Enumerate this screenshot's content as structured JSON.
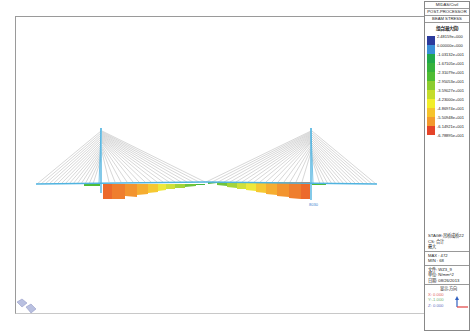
{
  "panel": {
    "header_line1": "MIDAS/Civil",
    "header_line2": "POST-PROCESSOR",
    "result_type": "BEAM STRESS",
    "legend_title": "组合(最大值)",
    "legend": [
      {
        "value": "2.48159e+000",
        "color": "#2b3a9c"
      },
      {
        "value": "0.00000e+000",
        "color": "#3a8fd6"
      },
      {
        "value": "-1.03132e+001",
        "color": "#21a84b"
      },
      {
        "value": "-1.67105e+001",
        "color": "#36b23c"
      },
      {
        "value": "-2.31079e+001",
        "color": "#4fbd33"
      },
      {
        "value": "-2.95053e+001",
        "color": "#8ccd2e"
      },
      {
        "value": "-3.59027e+001",
        "color": "#c5dc2a"
      },
      {
        "value": "-4.23000e+001",
        "color": "#f2ee2a"
      },
      {
        "value": "-4.86974e+001",
        "color": "#f6c32c"
      },
      {
        "value": "-5.50948e+001",
        "color": "#f39a2e"
      },
      {
        "value": "-6.14921e+001",
        "color": "#ee6a2c"
      },
      {
        "value": "-6.78895e+001",
        "color": "#e54429"
      }
    ],
    "stage": "STAGE:吊桥成桥22",
    "cs": "CS: 合计",
    "max_label": "最大",
    "max": "MAX : 472",
    "min": "MIN : 68",
    "file": "文件: WZ3_9",
    "unit": "单位: N/mm^2",
    "date": "日期: 08/26/2013",
    "view_dir_title": "显示-方向",
    "view_x": "X: 0.000",
    "view_y": "Y:-1.000",
    "view_z": "Z: 0.000"
  },
  "model": {
    "node_label": "8030",
    "colors": {
      "deck": "#4fb3e0",
      "cable": "#8a8a8a",
      "axis_x": "#e04040",
      "axis_z": "#3060c0"
    }
  }
}
